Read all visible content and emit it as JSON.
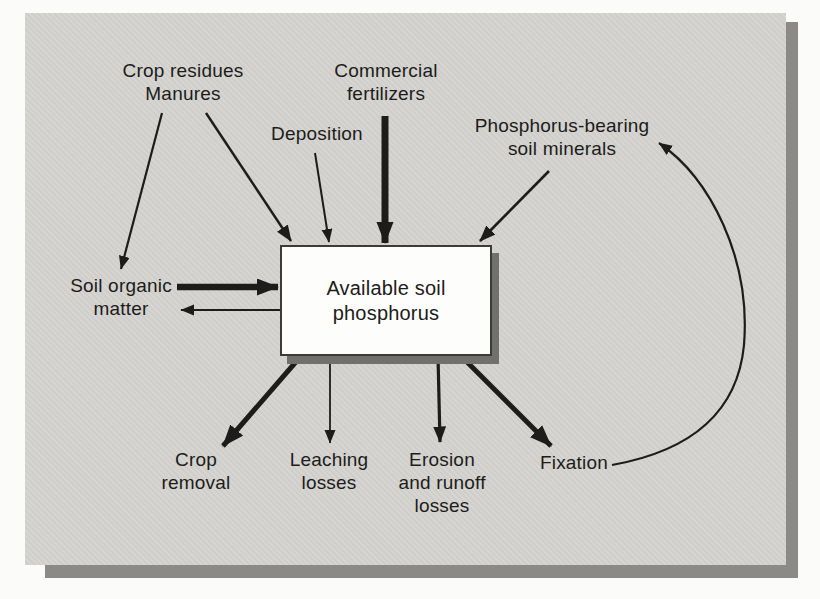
{
  "figure": {
    "colors": {
      "page_bg": "#fbfbf9",
      "panel_bg": "#d4d3d0",
      "panel_shadow": "#8b8a86",
      "ink": "#1d1c1a",
      "box_bg": "#fdfdfb",
      "box_border": "#3c3b37",
      "box_shadow": "#71706c"
    },
    "center_box": {
      "label": "Available soil\nphosphorus"
    },
    "sources": {
      "crop_residues": "Crop residues\nManures",
      "commercial_fertilizers": "Commercial\nfertilizers",
      "deposition": "Deposition",
      "phosphorus_minerals": "Phosphorus-bearing\nsoil minerals",
      "soil_organic_matter": "Soil organic\nmatter"
    },
    "sinks": {
      "crop_removal": "Crop\nremoval",
      "leaching_losses": "Leaching\nlosses",
      "erosion_losses": "Erosion\nand runoff\nlosses",
      "fixation": "Fixation"
    }
  }
}
